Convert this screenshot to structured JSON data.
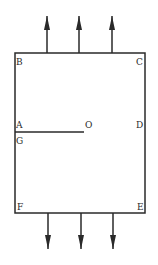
{
  "diagram": {
    "labels": {
      "B": "B",
      "C": "C",
      "A": "A",
      "G": "G",
      "O": "O",
      "D": "D",
      "F": "F",
      "E": "E"
    },
    "colors": {
      "stroke": "#2a2a2a",
      "background": "#ffffff"
    },
    "arrows_up": 3,
    "arrows_down": 3
  }
}
